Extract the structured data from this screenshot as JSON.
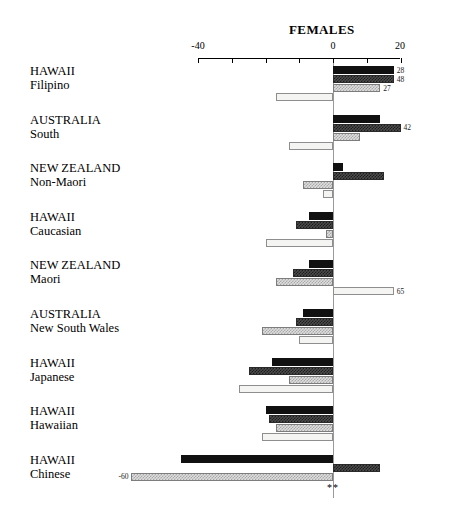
{
  "chart_data": {
    "type": "bar",
    "orientation": "horizontal",
    "title": "FEMALES",
    "xlabel": "",
    "ylabel": "",
    "xlim": [
      -40,
      20
    ],
    "xticks": [
      -40,
      -30,
      -20,
      -10,
      0,
      10,
      20
    ],
    "xticklabels_shown": [
      "-40",
      "0",
      "20"
    ],
    "grid": false,
    "legend": "none",
    "zero_reference_line": true,
    "categories": [
      "HAWAII Filipino",
      "AUSTRALIA South",
      "NEW ZEALAND Non-Maori",
      "HAWAII Caucasian",
      "NEW ZEALAND Maori",
      "AUSTRALIA New South Wales",
      "HAWAII Japanese",
      "HAWAII Hawaiian",
      "HAWAII Chinese"
    ],
    "series": [
      {
        "name": "series-1-black",
        "color": "#111111",
        "values": [
          18,
          14,
          3,
          -7,
          -7,
          -9,
          -18,
          -20,
          -45
        ]
      },
      {
        "name": "series-2-dark-hatch",
        "color": "#4d4d4d",
        "values": [
          18,
          20,
          15,
          -11,
          -12,
          -11,
          -25,
          -19,
          14
        ]
      },
      {
        "name": "series-3-light-hatch",
        "color": "#dedede",
        "values": [
          14,
          8,
          -9,
          -2,
          -17,
          -21,
          -13,
          -17,
          -60
        ]
      },
      {
        "name": "series-4-white",
        "color": "#f4f4f2",
        "values": [
          -17,
          -13,
          -3,
          -20,
          18,
          -10,
          -28,
          -21,
          0
        ]
      }
    ],
    "annotations": [
      {
        "group": 0,
        "series": 0,
        "text": "28",
        "side": "right"
      },
      {
        "group": 0,
        "series": 1,
        "text": "48",
        "side": "right"
      },
      {
        "group": 0,
        "series": 2,
        "text": "27",
        "side": "right"
      },
      {
        "group": 1,
        "series": 1,
        "text": "42",
        "side": "right"
      },
      {
        "group": 4,
        "series": 3,
        "text": "65",
        "side": "right"
      },
      {
        "group": 8,
        "series": 2,
        "text": "-60",
        "side": "left"
      },
      {
        "group": 8,
        "series": 2,
        "text": "**",
        "side": "significance"
      }
    ]
  },
  "axis": {
    "tick_labels": {
      "min": "-40",
      "zero": "0",
      "max": "20"
    }
  },
  "groups": [
    {
      "line1": "HAWAII",
      "line2": "Filipino"
    },
    {
      "line1": "AUSTRALIA",
      "line2": "South"
    },
    {
      "line1": "NEW ZEALAND",
      "line2": "Non-Maori"
    },
    {
      "line1": "HAWAII",
      "line2": "Caucasian"
    },
    {
      "line1": "NEW ZEALAND",
      "line2": "Maori"
    },
    {
      "line1": "AUSTRALIA",
      "line2": "New South Wales"
    },
    {
      "line1": "HAWAII",
      "line2": "Japanese"
    },
    {
      "line1": "HAWAII",
      "line2": "Hawaiian"
    },
    {
      "line1": "HAWAII",
      "line2": "Chinese"
    }
  ],
  "value_labels": {
    "g0s0": "28",
    "g0s1": "48",
    "g0s2": "27",
    "g1s1": "42",
    "g4s3": "65",
    "g8s2": "-60",
    "significance": "**"
  }
}
